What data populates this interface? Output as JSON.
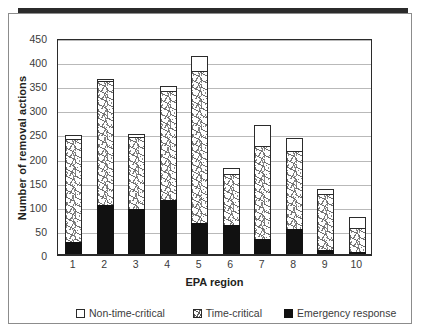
{
  "figure": {
    "frame_color": "#8c8c8c",
    "top_rule_color": "#2b2b2b"
  },
  "axes": {
    "y_title": "Number of removal actions",
    "x_title": "EPA region",
    "y_ticks": [
      "0",
      "50",
      "100",
      "150",
      "200",
      "250",
      "300",
      "350",
      "400",
      "450"
    ],
    "x_ticks": [
      "1",
      "2",
      "3",
      "4",
      "5",
      "6",
      "7",
      "8",
      "9",
      "10"
    ]
  },
  "legend": {
    "items": [
      {
        "label": "Non-time-critical",
        "icon": "white-square-swatch",
        "color": "#ffffff"
      },
      {
        "label": "Time-critical",
        "icon": "hatched-square-swatch",
        "color": "#ffffff"
      },
      {
        "label": "Emergency response",
        "icon": "black-square-swatch",
        "color": "#111111"
      }
    ]
  },
  "chart_data": {
    "type": "bar",
    "stacked": true,
    "title": "",
    "xlabel": "EPA region",
    "ylabel": "Number of removal actions",
    "categories": [
      "1",
      "2",
      "3",
      "4",
      "5",
      "6",
      "7",
      "8",
      "9",
      "10"
    ],
    "ylim": [
      0,
      450
    ],
    "ytick_step": 50,
    "grid": "horizontal",
    "legend_position": "bottom",
    "series": [
      {
        "name": "Emergency response",
        "color": "#111111",
        "values": [
          28,
          103,
          95,
          114,
          66,
          62,
          34,
          54,
          11,
          6
        ]
      },
      {
        "name": "Time-critical",
        "color": "#ffffff",
        "pattern": "speckled-hatch",
        "values": [
          212,
          258,
          149,
          227,
          315,
          105,
          193,
          161,
          116,
          51
        ]
      },
      {
        "name": "Non-time-critical",
        "color": "#ffffff",
        "values": [
          9,
          5,
          7,
          9,
          31,
          14,
          43,
          27,
          9,
          21
        ]
      }
    ],
    "totals": [
      249,
      366,
      251,
      350,
      412,
      181,
      270,
      242,
      136,
      78
    ]
  }
}
